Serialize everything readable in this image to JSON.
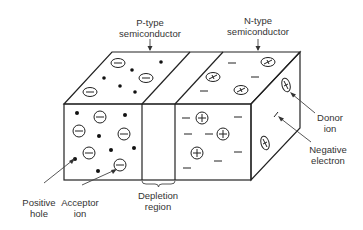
{
  "figure": {
    "labels": {
      "p_type": [
        "P-type",
        "semiconductor"
      ],
      "n_type": [
        "N-type",
        "semiconductor"
      ],
      "donor_ion": [
        "Donor",
        "ion"
      ],
      "negative_electron": [
        "Negative",
        "electron"
      ],
      "positive_hole": [
        "Positive",
        "hole"
      ],
      "acceptor_ion": [
        "Acceptor",
        "ion"
      ],
      "depletion_region": [
        "Depletion",
        "region"
      ]
    },
    "colors": {
      "line": "#222222",
      "text": "#333333",
      "background": "#ffffff"
    },
    "legend_symbols": {
      "acceptor_ion": "circled minus",
      "positive_hole": "filled dot",
      "donor_ion": "circled plus",
      "negative_electron": "dash"
    }
  }
}
